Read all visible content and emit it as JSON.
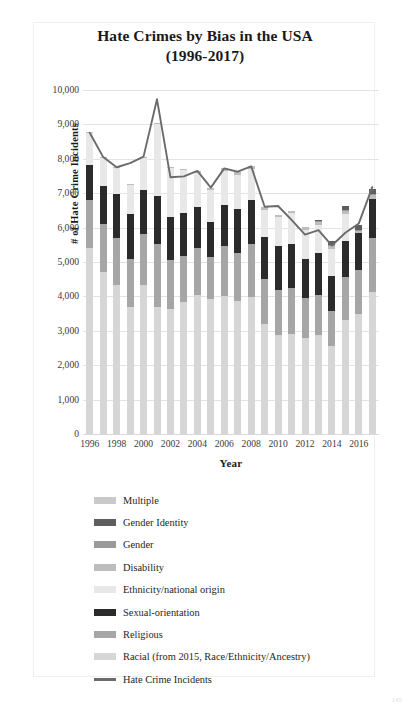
{
  "title": {
    "line1": "Hate Crimes by Bias in the USA",
    "line2": "(1996-2017)"
  },
  "axes": {
    "y_title": "# of Hate Crime Incidents",
    "x_title": "Year",
    "y_ticks": [
      "0",
      "1,000",
      "2,000",
      "3,000",
      "4,000",
      "5,000",
      "6,000",
      "7,000",
      "8,000",
      "9,000",
      "10,000"
    ],
    "x_ticks": [
      "1996",
      "1998",
      "2000",
      "2002",
      "2004",
      "2006",
      "2008",
      "2010",
      "2012",
      "2014",
      "2016"
    ]
  },
  "legend": {
    "items": [
      {
        "label": "Multiple",
        "color": "#c9c9c9",
        "kind": "bar"
      },
      {
        "label": "Gender Identity",
        "color": "#5e5e5e",
        "kind": "bar"
      },
      {
        "label": "Gender",
        "color": "#9a9a9a",
        "kind": "bar"
      },
      {
        "label": "Disability",
        "color": "#bdbdbd",
        "kind": "bar"
      },
      {
        "label": "Ethnicity/national origin",
        "color": "#e8e8e8",
        "kind": "bar"
      },
      {
        "label": "Sexual-orientation",
        "color": "#2b2b2b",
        "kind": "bar"
      },
      {
        "label": "Religious",
        "color": "#a6a6a6",
        "kind": "bar"
      },
      {
        "label": "Racial (from 2015, Race/Ethnicity/Ancestry)",
        "color": "#d6d6d6",
        "kind": "bar"
      },
      {
        "label": "Hate Crime Incidents",
        "color": "#6b6b6b",
        "kind": "line"
      }
    ]
  },
  "corner_mark": "145",
  "chart_data": {
    "type": "bar",
    "subtype": "stacked-bar-with-line-overlay",
    "title": "Hate Crimes by Bias in the USA (1996-2017)",
    "xlabel": "Year",
    "ylabel": "# of Hate Crime Incidents",
    "ylim": [
      0,
      10000
    ],
    "ytick_step": 1000,
    "grid": true,
    "legend_position": "below",
    "categories": [
      1996,
      1997,
      1998,
      1999,
      2000,
      2001,
      2002,
      2003,
      2004,
      2005,
      2006,
      2007,
      2008,
      2009,
      2010,
      2011,
      2012,
      2013,
      2014,
      2015,
      2016,
      2017
    ],
    "stack_order_bottom_to_top": [
      "Racial (from 2015, Race/Ethnicity/Ancestry)",
      "Religious",
      "Sexual-orientation",
      "Ethnicity/national origin",
      "Disability",
      "Gender",
      "Gender Identity",
      "Multiple"
    ],
    "series": [
      {
        "name": "Racial (from 2015, Race/Ethnicity/Ancestry)",
        "color": "#d6d6d6",
        "values": [
          5396,
          4710,
          4321,
          3679,
          4337,
          3700,
          3642,
          3844,
          4042,
          3919,
          4000,
          3870,
          3992,
          3199,
          2872,
          2917,
          2797,
          2871,
          2568,
          3310,
          3489,
          4131
        ]
      },
      {
        "name": "Religious",
        "color": "#a6a6a6",
        "values": [
          1401,
          1385,
          1390,
          1411,
          1472,
          1828,
          1426,
          1343,
          1374,
          1227,
          1462,
          1400,
          1519,
          1303,
          1322,
          1318,
          1166,
          1163,
          1014,
          1244,
          1273,
          1564
        ]
      },
      {
        "name": "Sexual-orientation",
        "color": "#2b2b2b",
        "values": [
          1016,
          1102,
          1260,
          1317,
          1299,
          1393,
          1244,
          1239,
          1197,
          1017,
          1195,
          1265,
          1297,
          1223,
          1277,
          1293,
          1135,
          1233,
          1017,
          1053,
          1076,
          1130
        ]
      },
      {
        "name": "Ethnicity/national origin",
        "color": "#e8e8e8",
        "values": [
          940,
          836,
          754,
          829,
          911,
          2098,
          1409,
          1236,
          972,
          944,
          984,
          1007,
          894,
          777,
          847,
          891,
          822,
          821,
          790,
          790,
          0,
          0
        ]
      },
      {
        "name": "Disability",
        "color": "#bdbdbd",
        "values": [
          12,
          12,
          25,
          19,
          36,
          35,
          45,
          33,
          73,
          53,
          79,
          82,
          85,
          99,
          47,
          58,
          102,
          83,
          84,
          88,
          70,
          116
        ]
      },
      {
        "name": "Gender",
        "color": "#9a9a9a",
        "values": [
          0,
          0,
          0,
          0,
          0,
          0,
          0,
          0,
          0,
          0,
          0,
          0,
          0,
          0,
          0,
          0,
          0,
          18,
          33,
          23,
          34,
          46
        ]
      },
      {
        "name": "Gender Identity",
        "color": "#5e5e5e",
        "values": [
          0,
          0,
          0,
          0,
          0,
          0,
          0,
          0,
          0,
          0,
          0,
          0,
          0,
          0,
          0,
          0,
          0,
          31,
          98,
          114,
          124,
          132
        ]
      },
      {
        "name": "Multiple",
        "color": "#c9c9c9",
        "values": [
          0,
          0,
          0,
          0,
          0,
          0,
          0,
          0,
          0,
          0,
          0,
          0,
          0,
          0,
          0,
          0,
          0,
          0,
          0,
          0,
          0,
          0
        ]
      }
    ],
    "line_series": {
      "name": "Hate Crime Incidents",
      "color": "#6b6b6b",
      "values": [
        8759,
        8049,
        7755,
        7876,
        8063,
        9730,
        7462,
        7489,
        7649,
        7163,
        7722,
        7624,
        7783,
        6604,
        6628,
        6222,
        5796,
        5928,
        5479,
        5850,
        6121,
        7175
      ]
    }
  }
}
